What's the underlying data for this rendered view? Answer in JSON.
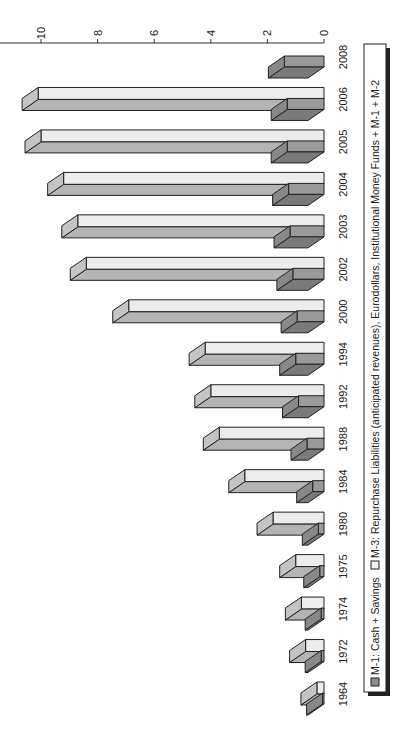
{
  "chart_data": {
    "type": "bar",
    "orientation": "rotated-90-ccw (3D clustered bars)",
    "title": "",
    "xlabel": "",
    "ylabel": "",
    "categories": [
      "1964",
      "1972",
      "1974",
      "1975",
      "1980",
      "1984",
      "1988",
      "1992",
      "1994",
      "2000",
      "2002",
      "2003",
      "2004",
      "2005",
      "2006",
      "2008"
    ],
    "series": [
      {
        "name": "M-1: Cash + Savings",
        "values": [
          0.05,
          0.1,
          0.1,
          0.15,
          0.2,
          0.4,
          0.6,
          0.9,
          1.0,
          0.95,
          1.1,
          1.2,
          1.25,
          1.3,
          1.3,
          1.4
        ],
        "color": "#8c8c8c"
      },
      {
        "name": "M-3: Repurchase Liabilities (anticipated revenues), Eurodollars, Institutional Money Funds + M-1 + M-2",
        "values": [
          0.25,
          0.65,
          0.8,
          1.0,
          1.8,
          2.8,
          3.7,
          4.0,
          4.2,
          6.9,
          8.4,
          8.7,
          9.2,
          10.0,
          10.1,
          null
        ],
        "color": "#ececec"
      }
    ],
    "ylim": [
      0,
      10
    ],
    "yticks": [
      "0",
      "2",
      "4",
      "6",
      "8",
      "10"
    ],
    "grid": false,
    "legend_position": "bottom"
  },
  "legend": {
    "items": [
      {
        "label": "M-1: Cash + Savings"
      },
      {
        "label": "M-3: Repurchase Liabilities (anticipated revenues), Eurodollars, Institutional Money Funds + M-1 + M-2"
      }
    ]
  }
}
